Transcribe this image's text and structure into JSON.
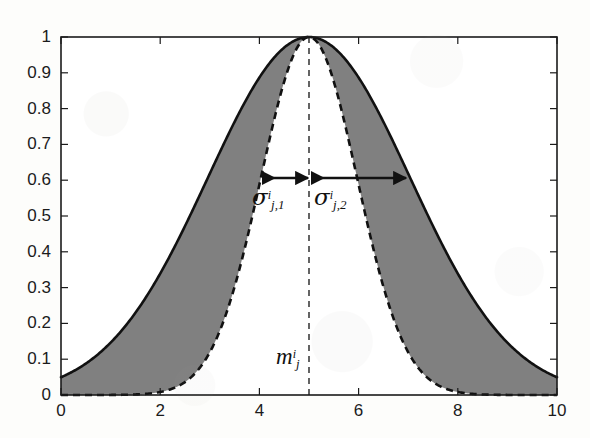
{
  "figure": {
    "background_color": "#fdfdfb",
    "fill_color": "#808080",
    "line_color": "#111111"
  },
  "axes": {
    "x_tick_labels": [
      "0",
      "2",
      "4",
      "6",
      "8",
      "10"
    ],
    "x_tick_values": [
      0,
      2,
      4,
      6,
      8,
      10
    ],
    "y_tick_labels": [
      "0",
      "0.1",
      "0.2",
      "0.3",
      "0.4",
      "0.5",
      "0.6",
      "0.7",
      "0.8",
      "0.9",
      "1"
    ],
    "y_tick_values": [
      0,
      0.1,
      0.2,
      0.3,
      0.4,
      0.5,
      0.6,
      0.7,
      0.8,
      0.9,
      1
    ]
  },
  "annotations": {
    "mean_label": {
      "base": "m",
      "sup": "i",
      "sub": "j"
    },
    "sigma_left_label": {
      "base": "σ",
      "sup": "i",
      "sub": "j,1"
    },
    "sigma_right_label": {
      "base": "σ",
      "sup": "i",
      "sub": "j,2"
    }
  },
  "chart_data": {
    "type": "line",
    "title": "",
    "xlabel": "",
    "ylabel": "",
    "xlim": [
      0,
      10
    ],
    "ylim": [
      0,
      1
    ],
    "grid": false,
    "legend": null,
    "x_ticks": [
      0,
      2,
      4,
      6,
      8,
      10
    ],
    "y_ticks": [
      0,
      0.1,
      0.2,
      0.3,
      0.4,
      0.5,
      0.6,
      0.7,
      0.8,
      0.9,
      1
    ],
    "tick_direction": "in",
    "box": true,
    "series": [
      {
        "name": "outer-gaussian-solid",
        "style": "solid",
        "color": "#111111",
        "peak": 1.0,
        "mean": 5.0,
        "sigma": 2.04,
        "x": [
          0,
          0.5,
          1,
          1.5,
          2,
          2.5,
          3,
          3.5,
          4,
          4.5,
          5,
          5.5,
          6,
          6.5,
          7,
          7.5,
          8,
          8.5,
          9,
          9.5,
          10
        ],
        "values": [
          0.06,
          0.1,
          0.16,
          0.24,
          0.34,
          0.45,
          0.57,
          0.7,
          0.83,
          0.93,
          1.0,
          0.93,
          0.83,
          0.7,
          0.57,
          0.45,
          0.34,
          0.24,
          0.16,
          0.1,
          0.06
        ]
      },
      {
        "name": "inner-gaussian-dashed",
        "style": "dashed",
        "color": "#111111",
        "peak": 1.0,
        "mean": 5.0,
        "sigma": 0.97,
        "x": [
          0,
          0.5,
          1,
          1.5,
          2,
          2.5,
          3,
          3.5,
          4,
          4.5,
          5,
          5.5,
          6,
          6.5,
          7,
          7.5,
          8,
          8.5,
          9,
          9.5,
          10
        ],
        "values": [
          0.0,
          0.0,
          0.0,
          0.0,
          0.01,
          0.03,
          0.09,
          0.23,
          0.47,
          0.79,
          1.0,
          0.79,
          0.47,
          0.23,
          0.09,
          0.03,
          0.01,
          0.0,
          0.0,
          0.0,
          0.0
        ]
      }
    ],
    "shaded_region": {
      "name": "between-curves",
      "color": "#808080",
      "upper": "outer-gaussian-solid",
      "lower": "inner-gaussian-dashed"
    },
    "annotations": [
      {
        "type": "vline",
        "name": "mean-line",
        "x": 5,
        "style": "dashed",
        "label": "m^i_j"
      },
      {
        "type": "double-arrow",
        "name": "sigma-left-arrow",
        "y": 0.6,
        "x_from": 3.95,
        "x_to": 5.0,
        "label": "sigma^i_{j,1}"
      },
      {
        "type": "double-arrow",
        "name": "sigma-right-arrow",
        "y": 0.6,
        "x_from": 5.0,
        "x_to": 7.0,
        "label": "sigma^i_{j,2}"
      }
    ]
  }
}
